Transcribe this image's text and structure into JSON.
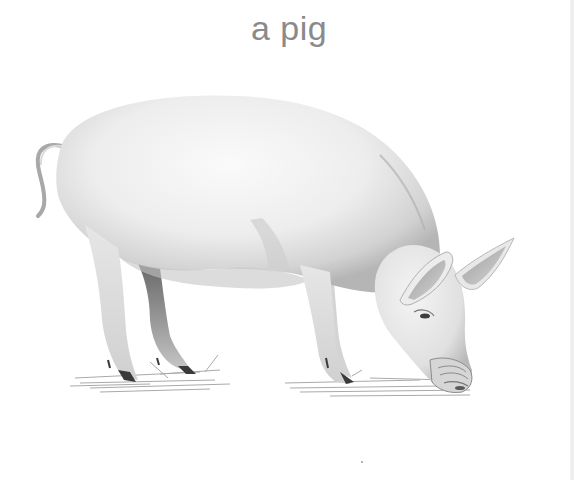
{
  "caption": {
    "text": "a pig",
    "color": "#8a8a8a"
  },
  "illustration": {
    "subject": "pig",
    "description": "grayscale pencil drawing of a pig grazing with its snout to the ground",
    "palette": {
      "body_light": "#f2f2f2",
      "body_mid": "#d9d9d9",
      "shadow": "#9a9a9a",
      "dark": "#555555",
      "grass": "#8c8c8c"
    }
  }
}
